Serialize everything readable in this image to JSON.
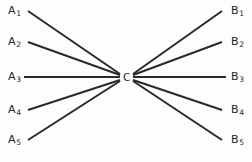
{
  "figure": {
    "type": "node-link-diagram",
    "background_color": "#fdfdfd",
    "line_color": "#2a2a2a",
    "text_color": "#262626",
    "center_label": "C",
    "left_nodes": [
      {
        "base": "A",
        "sub": "1"
      },
      {
        "base": "A",
        "sub": "2"
      },
      {
        "base": "A",
        "sub": "3"
      },
      {
        "base": "A",
        "sub": "4"
      },
      {
        "base": "A",
        "sub": "5"
      }
    ],
    "right_nodes": [
      {
        "base": "B",
        "sub": "1"
      },
      {
        "base": "B",
        "sub": "2"
      },
      {
        "base": "B",
        "sub": "3"
      },
      {
        "base": "B",
        "sub": "4"
      },
      {
        "base": "B",
        "sub": "5"
      }
    ]
  },
  "chart_data": {
    "type": "diagram",
    "title": "",
    "center": {
      "label": "C",
      "x": 126,
      "y": 77
    },
    "left_hub": {
      "x": 120,
      "y": 77
    },
    "right_hub": {
      "x": 133,
      "y": 77
    },
    "nodes": [
      {
        "id": "A1",
        "label": "A1",
        "side": "left",
        "x": 14,
        "y": 11
      },
      {
        "id": "A2",
        "label": "A2",
        "side": "left",
        "x": 14,
        "y": 42
      },
      {
        "id": "A3",
        "label": "A3",
        "side": "left",
        "x": 14,
        "y": 77
      },
      {
        "id": "A4",
        "label": "A4",
        "side": "left",
        "x": 14,
        "y": 110
      },
      {
        "id": "A5",
        "label": "A5",
        "side": "left",
        "x": 14,
        "y": 140
      },
      {
        "id": "C",
        "label": "C",
        "side": "center",
        "x": 126,
        "y": 77
      },
      {
        "id": "B1",
        "label": "B1",
        "side": "right",
        "x": 237,
        "y": 11
      },
      {
        "id": "B2",
        "label": "B2",
        "side": "right",
        "x": 237,
        "y": 42
      },
      {
        "id": "B3",
        "label": "B3",
        "side": "right",
        "x": 237,
        "y": 77
      },
      {
        "id": "B4",
        "label": "B4",
        "side": "right",
        "x": 237,
        "y": 110
      },
      {
        "id": "B5",
        "label": "B5",
        "side": "right",
        "x": 237,
        "y": 140
      }
    ],
    "edges": [
      {
        "from": "A1",
        "to": "C",
        "x1": 28,
        "y1": 11,
        "x2": 120,
        "y2": 74
      },
      {
        "from": "A2",
        "to": "C",
        "x1": 28,
        "y1": 42,
        "x2": 120,
        "y2": 75
      },
      {
        "from": "A3",
        "to": "C",
        "x1": 24,
        "y1": 77,
        "x2": 120,
        "y2": 77
      },
      {
        "from": "A4",
        "to": "C",
        "x1": 28,
        "y1": 110,
        "x2": 120,
        "y2": 80
      },
      {
        "from": "A5",
        "to": "C",
        "x1": 28,
        "y1": 140,
        "x2": 120,
        "y2": 81
      },
      {
        "from": "C",
        "to": "B1",
        "x1": 133,
        "y1": 74,
        "x2": 222,
        "y2": 11
      },
      {
        "from": "C",
        "to": "B2",
        "x1": 133,
        "y1": 75,
        "x2": 222,
        "y2": 42
      },
      {
        "from": "C",
        "to": "B3",
        "x1": 133,
        "y1": 77,
        "x2": 226,
        "y2": 77
      },
      {
        "from": "C",
        "to": "B4",
        "x1": 133,
        "y1": 80,
        "x2": 222,
        "y2": 110
      },
      {
        "from": "C",
        "to": "B5",
        "x1": 133,
        "y1": 81,
        "x2": 222,
        "y2": 140
      }
    ],
    "legend": [],
    "annotations": []
  }
}
